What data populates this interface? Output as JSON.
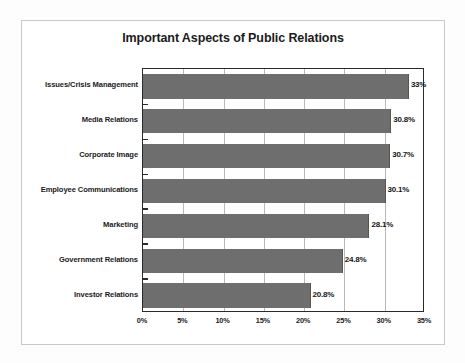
{
  "chart_data": {
    "type": "bar",
    "orientation": "horizontal",
    "title": "Important Aspects of Public Relations",
    "xlabel": "",
    "ylabel": "",
    "categories": [
      "Issues/Crisis Management",
      "Media Relations",
      "Corporate Image",
      "Employee Communications",
      "Marketing",
      "Government Relations",
      "Investor Relations"
    ],
    "values": [
      33,
      30.8,
      30.7,
      30.1,
      28.1,
      24.8,
      20.8
    ],
    "data_labels": [
      "33%",
      "30.8%",
      "30.7%",
      "30.1%",
      "28.1%",
      "24.8%",
      "20.8%"
    ],
    "xlim": [
      0,
      35
    ],
    "xticks": [
      0,
      5,
      10,
      15,
      20,
      25,
      30,
      35
    ],
    "xtick_labels": [
      "0%",
      "5%",
      "10%",
      "15%",
      "20%",
      "25%",
      "30%",
      "35%"
    ],
    "grid": true,
    "grid_axis": "x",
    "legend": false,
    "bar_color": "#6e6e6e",
    "axis_color": "#2a2a2a",
    "gridline_color": "#b8b8b8",
    "background_color": "#ffffff",
    "frame_color": "#c9c9c9"
  }
}
